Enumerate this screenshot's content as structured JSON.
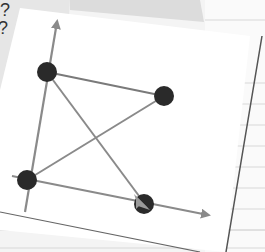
{
  "scene": {
    "background_color": "#f4f4f4",
    "paper_color": "#ffffff",
    "back_sheet_color": "#e4e4e4",
    "note_text": "?\n?"
  },
  "diagram": {
    "axis_color": "#8a8a8a",
    "edge_color": "#8a8a8a",
    "node_color": "#2a2a2a",
    "nodes": [
      {
        "id": "top-left",
        "x": 47,
        "y": 72
      },
      {
        "id": "right",
        "x": 164,
        "y": 96
      },
      {
        "id": "bottom-left",
        "x": 27,
        "y": 180
      },
      {
        "id": "bottom-right",
        "x": 144,
        "y": 204
      }
    ],
    "edges": [
      {
        "from": "top-left",
        "to": "right"
      },
      {
        "from": "top-left",
        "to": "bottom-right",
        "arrow": true
      },
      {
        "from": "bottom-left",
        "to": "right"
      },
      {
        "from": "bottom-left",
        "to": "top-left"
      }
    ],
    "axes": {
      "y_axis": {
        "from": [
          24,
          212
        ],
        "to": [
          58,
          18
        ]
      },
      "x_axis": {
        "from": [
          12,
          176
        ],
        "to": [
          214,
          216
        ]
      }
    }
  }
}
